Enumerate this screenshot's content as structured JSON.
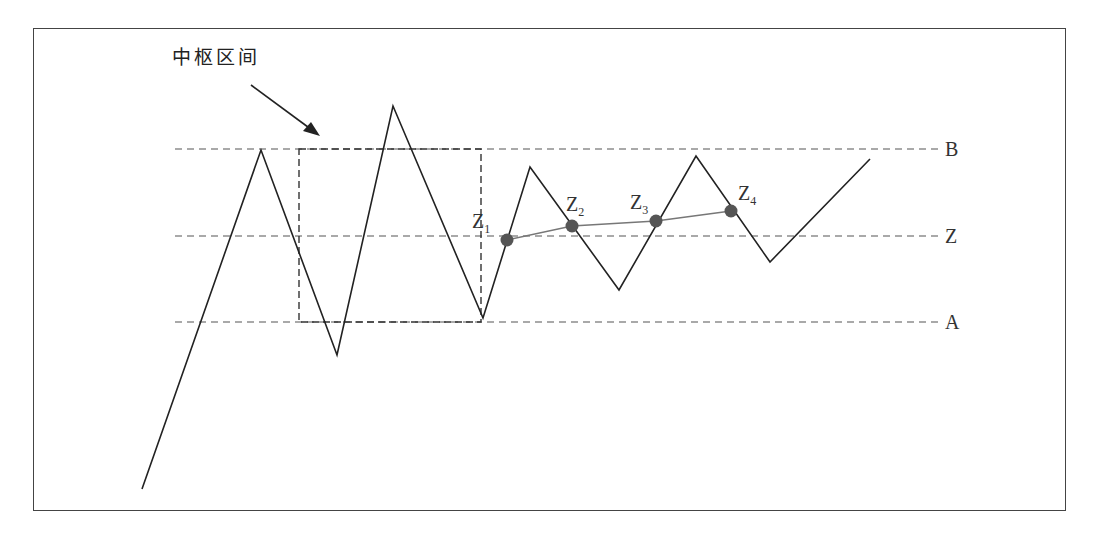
{
  "diagram": {
    "annotation": "中枢区间",
    "level_labels": {
      "upper": "B",
      "middle": "Z",
      "lower": "A"
    },
    "points": [
      {
        "main": "Z",
        "sub": "1"
      },
      {
        "main": "Z",
        "sub": "2"
      },
      {
        "main": "Z",
        "sub": "3"
      },
      {
        "main": "Z",
        "sub": "4"
      }
    ],
    "colors": {
      "line": "#222222",
      "dashed": "#555555",
      "dot": "#555555",
      "connector": "#777777"
    }
  }
}
